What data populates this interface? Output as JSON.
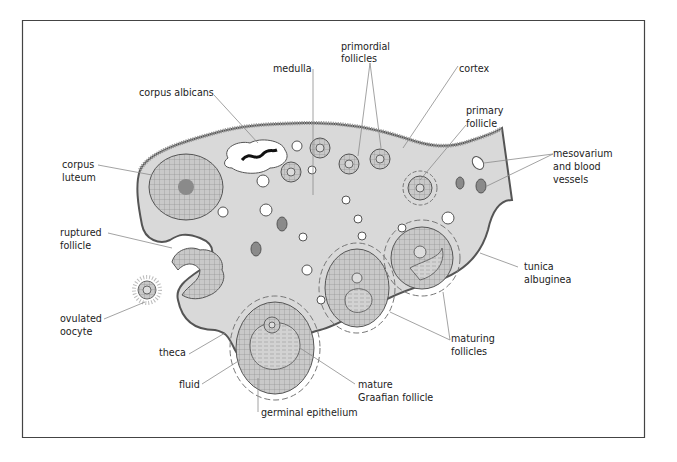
{
  "diagram": {
    "colors": {
      "frame": "#333333",
      "tissue_fill": "#d9d9d9",
      "cell_fill": "#c8c8c8",
      "dark_fill": "#8a8a8a",
      "leader_line": "#8c8c8c",
      "text": "#222222",
      "background": "#ffffff"
    },
    "labels": {
      "medulla": "medulla",
      "primordial_1": "primordial",
      "primordial_2": "follicles",
      "cortex": "cortex",
      "corpus_albicans": "corpus albicans",
      "primary_1": "primary",
      "primary_2": "follicle",
      "corpus_luteum_1": "corpus",
      "corpus_luteum_2": "luteum",
      "mesovarium_1": "mesovarium",
      "mesovarium_2": "and blood",
      "mesovarium_3": "vessels",
      "ruptured_1": "ruptured",
      "ruptured_2": "follicle",
      "tunica_1": "tunica",
      "tunica_2": "albuginea",
      "ovulated_1": "ovulated",
      "ovulated_2": "oocyte",
      "maturing_1": "maturing",
      "maturing_2": "follicles",
      "theca": "theca",
      "fluid": "fluid",
      "mature_1": "mature",
      "mature_2": "Graafian follicle",
      "germinal": "germinal epithelium"
    }
  }
}
